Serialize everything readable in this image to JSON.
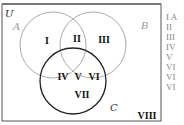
{
  "diagram": {
    "type": "venn-3-set",
    "universe_label": "U",
    "sets": [
      {
        "name": "A",
        "color": "#aaaaaa"
      },
      {
        "name": "B",
        "color": "#aaaaaa"
      },
      {
        "name": "C",
        "color": "#222222"
      }
    ],
    "regions": [
      "I",
      "II",
      "III",
      "IV",
      "V",
      "VI",
      "VII",
      "VIII"
    ],
    "colors": {
      "border": "#555555",
      "light_circle": "#aaaaaa",
      "dark_circle": "#222222",
      "region_text": "#111111",
      "list_text": "#888888"
    }
  },
  "side_list": [
    "I A",
    "II",
    "III",
    "IV",
    "V",
    "VI",
    "VI",
    "VI"
  ]
}
